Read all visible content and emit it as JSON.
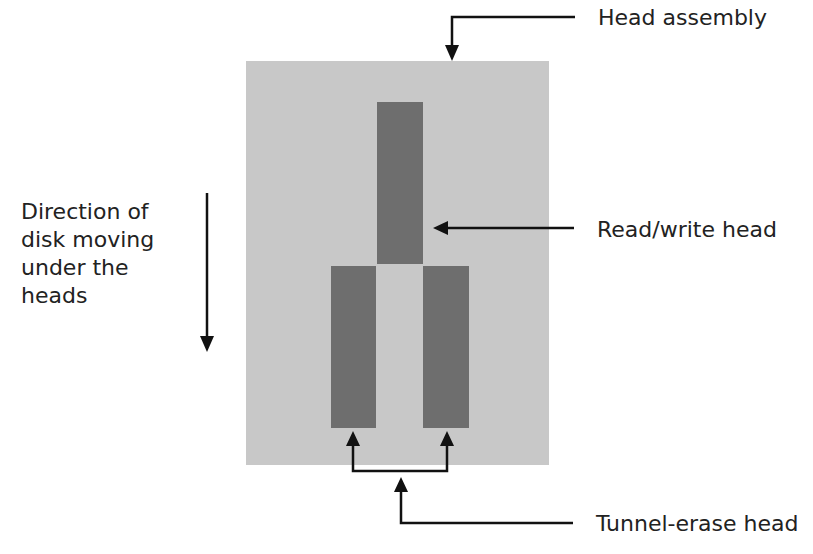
{
  "diagram": {
    "labels": {
      "head_assembly": "Head assembly",
      "read_write_head": "Read/write head",
      "tunnel_erase_head": "Tunnel-erase head",
      "direction": [
        "Direction of",
        "disk moving",
        "under the",
        "heads"
      ]
    },
    "colors": {
      "assembly_fill": "#c8c8c8",
      "head_fill": "#6e6e6e",
      "line": "#111111",
      "text": "#222222"
    }
  }
}
